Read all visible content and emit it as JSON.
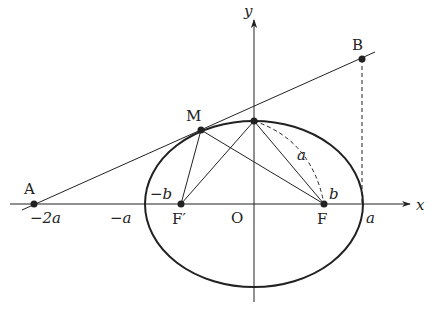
{
  "diagram": {
    "axes": {
      "x_label": "x",
      "y_label": "y",
      "origin_label": "O"
    },
    "points": {
      "A": {
        "label": "A",
        "coord_label": "−2a"
      },
      "B": {
        "label": "B"
      },
      "M": {
        "label": "M"
      },
      "F": {
        "label": "F"
      },
      "F_prime": {
        "label": "F′"
      }
    },
    "tick_labels": {
      "neg_a": "−a",
      "pos_a": "a",
      "neg_b": "−b",
      "b": "b",
      "a_arc": "a"
    },
    "colors": {
      "stroke": "#222222",
      "background": "#ffffff"
    }
  }
}
